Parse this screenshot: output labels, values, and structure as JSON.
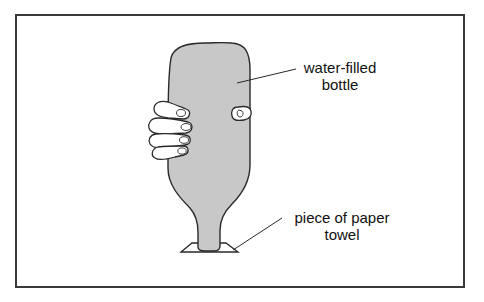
{
  "diagram": {
    "title": "",
    "labels": {
      "bottle_line1": "water-filled",
      "bottle_line2": "bottle",
      "towel_line1": "piece of paper",
      "towel_line2": "towel"
    },
    "colors": {
      "bottle_fill": "#c8c8c8",
      "outline": "#2a2a2a",
      "frame": "#3a3a3a",
      "background": "#ffffff"
    },
    "elements": [
      {
        "name": "water-filled bottle",
        "type": "bottle",
        "orientation": "upside-down"
      },
      {
        "name": "hand",
        "type": "hand",
        "gripping": "bottle"
      },
      {
        "name": "piece of paper towel",
        "type": "sheet",
        "position": "under bottle neck"
      }
    ]
  }
}
